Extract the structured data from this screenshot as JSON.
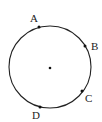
{
  "diagram": {
    "type": "circle-with-points",
    "circle": {
      "cx": 50,
      "cy": 67,
      "r": 41,
      "stroke": "#222222"
    },
    "center_dot": {
      "x": 50,
      "y": 68
    },
    "points": [
      {
        "label": "A",
        "x": 39,
        "y": 27,
        "lx": 30,
        "ly": 22
      },
      {
        "label": "B",
        "x": 85,
        "y": 46,
        "lx": 91,
        "ly": 50
      },
      {
        "label": "C",
        "x": 82,
        "y": 91,
        "lx": 85,
        "ly": 102
      },
      {
        "label": "D",
        "x": 40,
        "y": 107,
        "lx": 32,
        "ly": 119
      }
    ]
  }
}
